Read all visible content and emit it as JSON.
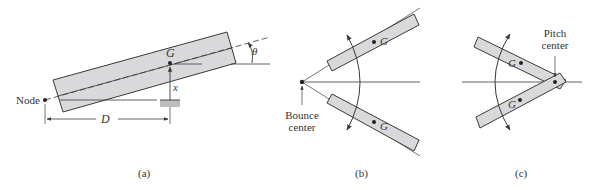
{
  "colors": {
    "ink": "#3a3a3a",
    "fill": "#d9d9dc",
    "background": "#ffffff"
  },
  "panel_a": {
    "caption": "(a)",
    "node_label": "Node",
    "cg_label": "G",
    "displacement_label": "x",
    "distance_label": "D",
    "angle_label": "θ"
  },
  "panel_b": {
    "caption": "(b)",
    "center_label_line1": "Bounce",
    "center_label_line2": "center",
    "cg_label_top": "G",
    "cg_label_bottom": "G"
  },
  "panel_c": {
    "caption": "(c)",
    "center_label_line1": "Pitch",
    "center_label_line2": "center",
    "cg_label_top": "G",
    "cg_label_bottom": "G"
  }
}
